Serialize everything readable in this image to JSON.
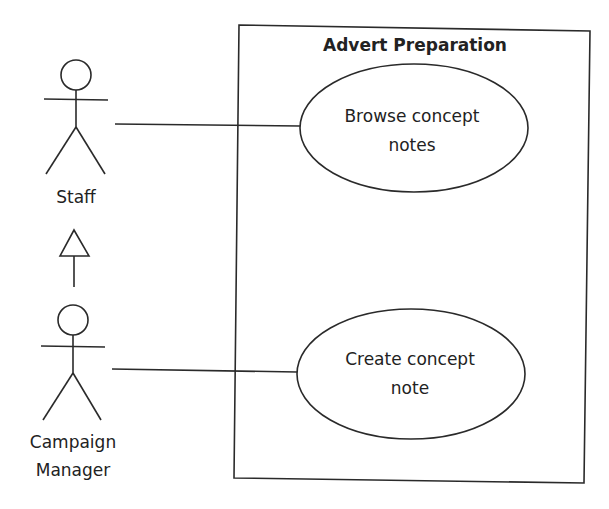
{
  "diagram": {
    "type": "uml-use-case",
    "system_boundary": {
      "title": "Advert Preparation"
    },
    "actors": [
      {
        "id": "staff",
        "label": "Staff"
      },
      {
        "id": "campaign_manager",
        "label_lines": [
          "Campaign",
          "Manager"
        ]
      }
    ],
    "use_cases": [
      {
        "id": "browse",
        "label_lines": [
          "Browse concept",
          "notes"
        ]
      },
      {
        "id": "create",
        "label_lines": [
          "Create concept",
          "note"
        ]
      }
    ],
    "associations": [
      {
        "from": "staff",
        "to": "browse"
      },
      {
        "from": "campaign_manager",
        "to": "create"
      }
    ],
    "generalizations": [
      {
        "child": "campaign_manager",
        "parent": "staff"
      }
    ],
    "colors": {
      "line": "#2a2a2a",
      "background": "#ffffff"
    }
  }
}
